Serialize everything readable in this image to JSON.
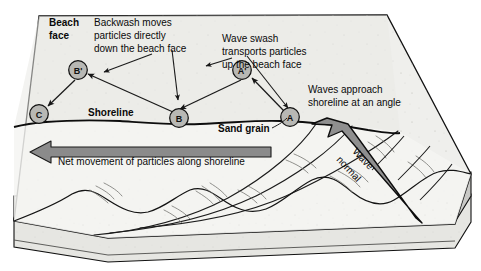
{
  "diagram": {
    "labels": {
      "beach_face_line1": "Beach",
      "beach_face_line2": "face",
      "backwash_line1": "Backwash moves",
      "backwash_line2": "particles  directly",
      "backwash_line3": "down the beach face",
      "swash_line1": "Wave swash",
      "swash_line2": "transports particles",
      "swash_line3": "up the beach face",
      "approach_line1": "Waves approach",
      "approach_line2": "shoreline at an angle",
      "shoreline": "Shoreline",
      "sand_grain": "Sand grain",
      "net_movement": "Net movement of particles along shoreline",
      "wave_normal_line1": "Wave",
      "wave_normal_line2": "normal"
    },
    "markers": [
      {
        "id": "b-prime",
        "text": "B'",
        "x": 78,
        "y": 70
      },
      {
        "id": "a-prime",
        "text": "A'",
        "x": 242,
        "y": 70
      },
      {
        "id": "c",
        "text": "C",
        "x": 39,
        "y": 114
      },
      {
        "id": "b",
        "text": "B",
        "x": 179,
        "y": 118
      },
      {
        "id": "a",
        "text": "A",
        "x": 290,
        "y": 117
      }
    ],
    "colors": {
      "beach_surface": "#e9e9e5",
      "water_surface": "#f2f2f0",
      "sediment_band": "#c9c9c6",
      "base_band": "#e2e2de",
      "arrow_fill": "#8b8b8b",
      "marker_fill": "#b8b8b4",
      "outline": "#111111",
      "text": "#0a0a0a",
      "background": "#ffffff"
    }
  }
}
